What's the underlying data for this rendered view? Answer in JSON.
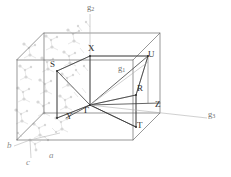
{
  "figure": {
    "type": "brillouin-zone-diagram",
    "colors": {
      "cell_edge": "#5a5a5a",
      "path_line": "#404040",
      "structure": "#c9c9c9",
      "axis_label": "#8e8e8e",
      "reciprocal_label": "#6e6e6e",
      "symmetry_label": "#2d2d2d",
      "background": "#ffffff"
    }
  },
  "symmetry_points": [
    {
      "label": "Γ",
      "name": "gamma",
      "x": 84,
      "y": 105
    },
    {
      "label": "S",
      "name": "s",
      "x": 57,
      "y": 64
    },
    {
      "label": "X",
      "name": "x",
      "x": 90,
      "y": 50
    },
    {
      "label": "U",
      "name": "u",
      "x": 148,
      "y": 63
    },
    {
      "label": "R",
      "name": "r",
      "x": 139,
      "y": 89
    },
    {
      "label": "Z",
      "name": "z",
      "x": 155,
      "y": 107
    },
    {
      "label": "T",
      "name": "t",
      "x": 139,
      "y": 124
    },
    {
      "label": "Y",
      "name": "y",
      "x": 70,
      "y": 114
    }
  ],
  "reciprocal_vectors": [
    {
      "label": "g",
      "sub": "2",
      "name": "g2",
      "x": 87,
      "y": 6
    },
    {
      "label": "g",
      "sub": "1",
      "name": "g1",
      "x": 120,
      "y": 68
    },
    {
      "label": "g",
      "sub": "3",
      "name": "g3",
      "x": 210,
      "y": 113
    }
  ],
  "crystal_axes": [
    {
      "label": "b",
      "name": "b",
      "x": 8,
      "y": 145
    },
    {
      "label": "c",
      "name": "c",
      "x": 27,
      "y": 162
    },
    {
      "label": "a",
      "name": "a",
      "x": 50,
      "y": 155
    }
  ]
}
